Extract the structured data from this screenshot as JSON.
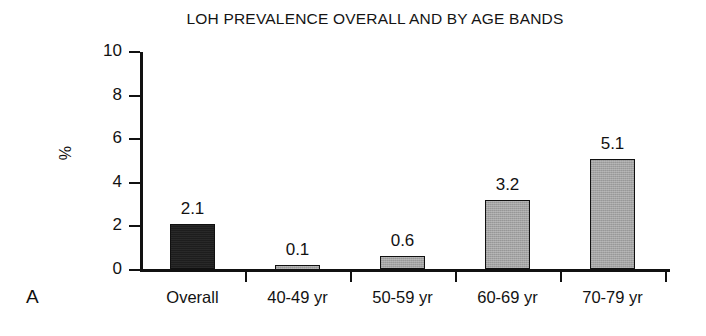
{
  "figure": {
    "panel_label": "A",
    "background_color": "#ffffff"
  },
  "chart_data": {
    "type": "bar",
    "title": "LOH PREVALENCE OVERALL AND BY AGE BANDS",
    "xlabel": "",
    "ylabel": "%",
    "categories": [
      "Overall",
      "40-49 yr",
      "50-59 yr",
      "60-69 yr",
      "70-79 yr"
    ],
    "values": [
      2.1,
      0.1,
      0.6,
      3.2,
      5.1
    ],
    "data_labels": [
      "2.1",
      "0.1",
      "0.6",
      "3.2",
      "5.1"
    ],
    "bar_colors": [
      "#1d1d1d",
      "#a3a3a3",
      "#a3a3a3",
      "#a3a3a3",
      "#a3a3a3"
    ],
    "ylim": [
      0,
      10
    ],
    "yticks": [
      0,
      2,
      4,
      6,
      8,
      10
    ],
    "ytick_labels": [
      "0",
      "2",
      "4",
      "6",
      "8",
      "10"
    ],
    "grid": false,
    "legend": false
  }
}
